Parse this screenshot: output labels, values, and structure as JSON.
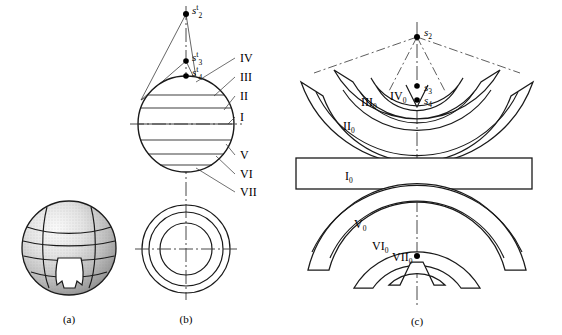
{
  "figure": {
    "panels": [
      {
        "id": "a",
        "caption": "(a)",
        "description": "shaded sphere with latitude zone bands and carved wedge"
      },
      {
        "id": "b",
        "caption": "(b)",
        "description": "front view of zoned sphere with apex points and top view of concentric circles"
      },
      {
        "id": "c",
        "caption": "(c)",
        "description": "unfolded development of the zones as nested arc bands"
      }
    ]
  },
  "panel_b": {
    "apex_points": [
      {
        "name": "s2-prime",
        "label": "s",
        "sub": "2",
        "prime": "t"
      },
      {
        "name": "s3-prime",
        "label": "s",
        "sub": "3",
        "prime": "t"
      },
      {
        "name": "s4-prime",
        "label": "s",
        "sub": "4",
        "prime": "t"
      }
    ],
    "zone_labels": [
      "IV",
      "III",
      "II",
      "I",
      "V",
      "VI",
      "VII"
    ]
  },
  "panel_c": {
    "points": [
      {
        "name": "s2",
        "label": "s",
        "sub": "2"
      },
      {
        "name": "s3",
        "label": "s",
        "sub": "3"
      },
      {
        "name": "s4",
        "label": "s",
        "sub": "4"
      }
    ],
    "band_labels": [
      {
        "roman": "II",
        "sub": "0"
      },
      {
        "roman": "III",
        "sub": "0"
      },
      {
        "roman": "IV",
        "sub": "0"
      },
      {
        "roman": "I",
        "sub": "0"
      },
      {
        "roman": "V",
        "sub": "0"
      },
      {
        "roman": "VI",
        "sub": "0"
      },
      {
        "roman": "VII",
        "sub": "0"
      }
    ]
  },
  "colors": {
    "stroke": "#1a1a1a",
    "thin": "#333333",
    "background": "#ffffff",
    "shade_light": "#f2f2f2",
    "shade_mid": "#c9c9c9",
    "shade_dark": "#8f8f8f"
  }
}
